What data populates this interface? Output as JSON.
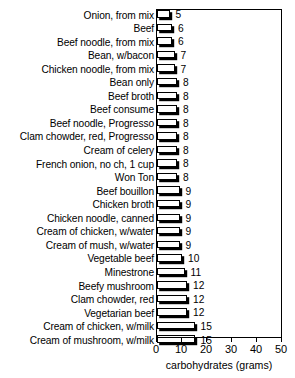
{
  "chart_data": {
    "type": "bar",
    "orientation": "horizontal",
    "title": "",
    "xlabel": "carbohydrates (grams)",
    "ylabel": "",
    "xlim": [
      0,
      50
    ],
    "xticks": [
      0,
      10,
      20,
      30,
      40,
      50
    ],
    "grid": false,
    "legend": null,
    "value_labels": true,
    "categories": [
      "Onion, from mix",
      "Beef",
      "Beef noodle, from mix",
      "Bean, w/bacon",
      "Chicken noodle, from mix",
      "Bean only",
      "Beef broth",
      "Beef consume",
      "Beef noodle, Progresso",
      "Clam chowder, red, Progresso",
      "Cream of celery",
      "French onion, no ch, 1 cup",
      "Won Ton",
      "Beef bouillon",
      "Chicken broth",
      "Chicken noodle, canned",
      "Cream of chicken, w/water",
      "Cream of mush, w/water",
      "Vegetable beef",
      "Minestrone",
      "Beefy mushroom",
      "Clam chowder, red",
      "Vegetarian beef",
      "Cream of chicken, w/milk",
      "Cream of mushroom, w/milk"
    ],
    "values": [
      5,
      6,
      6,
      7,
      7,
      8,
      8,
      8,
      8,
      8,
      8,
      8,
      8,
      9,
      9,
      9,
      9,
      9,
      10,
      11,
      12,
      12,
      12,
      15,
      15
    ]
  },
  "colors": {
    "bar_face": "#ffffff",
    "bar_outline": "#000000",
    "bar_shadow": "#000000",
    "axis": "#000000",
    "background": "#ffffff"
  }
}
